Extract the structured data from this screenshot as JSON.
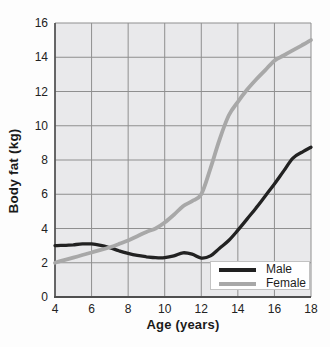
{
  "chart_data": {
    "type": "line",
    "title": "",
    "xlabel": "Age (years)",
    "ylabel": "Body fat (kg)",
    "xlim": [
      4,
      18
    ],
    "ylim": [
      0,
      16
    ],
    "x_ticks": [
      4,
      6,
      8,
      10,
      12,
      14,
      16,
      18
    ],
    "y_ticks": [
      0,
      2,
      4,
      6,
      8,
      10,
      12,
      14,
      16
    ],
    "grid": true,
    "legend_position": "bottom-right",
    "series": [
      {
        "name": "Male",
        "color": "#222222",
        "points": [
          [
            4,
            3.0
          ],
          [
            4.5,
            3.02
          ],
          [
            5,
            3.05
          ],
          [
            5.5,
            3.1
          ],
          [
            6,
            3.1
          ],
          [
            6.5,
            3.02
          ],
          [
            7,
            2.88
          ],
          [
            7.5,
            2.7
          ],
          [
            8,
            2.55
          ],
          [
            8.5,
            2.43
          ],
          [
            9,
            2.35
          ],
          [
            9.5,
            2.3
          ],
          [
            10,
            2.3
          ],
          [
            10.5,
            2.4
          ],
          [
            11,
            2.58
          ],
          [
            11.5,
            2.5
          ],
          [
            12,
            2.27
          ],
          [
            12.5,
            2.4
          ],
          [
            13,
            2.85
          ],
          [
            13.5,
            3.3
          ],
          [
            14,
            3.9
          ],
          [
            14.5,
            4.55
          ],
          [
            15,
            5.2
          ],
          [
            15.5,
            5.9
          ],
          [
            16,
            6.6
          ],
          [
            16.5,
            7.35
          ],
          [
            17,
            8.1
          ],
          [
            17.5,
            8.45
          ],
          [
            18,
            8.75
          ]
        ]
      },
      {
        "name": "Female",
        "color": "#a8a8a8",
        "points": [
          [
            4,
            2.0
          ],
          [
            4.5,
            2.15
          ],
          [
            5,
            2.3
          ],
          [
            5.5,
            2.45
          ],
          [
            6,
            2.6
          ],
          [
            6.5,
            2.75
          ],
          [
            7,
            2.9
          ],
          [
            7.5,
            3.1
          ],
          [
            8,
            3.3
          ],
          [
            8.5,
            3.55
          ],
          [
            9,
            3.8
          ],
          [
            9.5,
            4.0
          ],
          [
            10,
            4.35
          ],
          [
            10.5,
            4.8
          ],
          [
            11,
            5.3
          ],
          [
            11.5,
            5.6
          ],
          [
            12,
            6.0
          ],
          [
            12.5,
            7.5
          ],
          [
            13,
            9.2
          ],
          [
            13.5,
            10.6
          ],
          [
            14,
            11.4
          ],
          [
            14.5,
            12.1
          ],
          [
            15,
            12.7
          ],
          [
            15.5,
            13.25
          ],
          [
            16,
            13.8
          ],
          [
            16.5,
            14.1
          ],
          [
            17,
            14.4
          ],
          [
            17.5,
            14.7
          ],
          [
            18,
            15.0
          ]
        ]
      }
    ]
  },
  "colors": {
    "plot_bg": "#e9e9eb",
    "grid": "#8f8f8f",
    "axis": "#4f4f4f",
    "legend_bg": "#ffffff",
    "legend_border": "#c2c2c2",
    "text": "#1a1a1a"
  }
}
